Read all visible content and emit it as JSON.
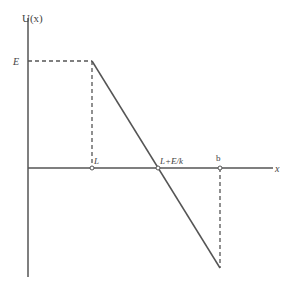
{
  "diagram": {
    "y_axis_label": "U(x)",
    "x_axis_label": "x",
    "level_label": "E",
    "point_labels": {
      "L": "L",
      "zero_crossing": "L+E/k",
      "b": "b"
    },
    "colors": {
      "axis": "#555555",
      "curve": "#555555",
      "dashed": "#555555"
    }
  }
}
